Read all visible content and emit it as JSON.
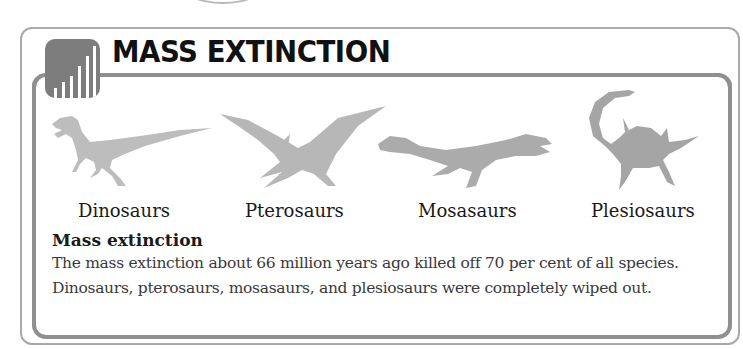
{
  "header": {
    "title": "MASS EXTINCTION",
    "icon": "bar-chart-icon"
  },
  "creatures": [
    {
      "name": "dinosaur",
      "label": "Dinosaurs",
      "icon": "dinosaur-silhouette"
    },
    {
      "name": "pterosaur",
      "label": "Pterosaurs",
      "icon": "pterosaur-silhouette"
    },
    {
      "name": "mosasaur",
      "label": "Mosasaurs",
      "icon": "mosasaur-silhouette"
    },
    {
      "name": "plesiosaur",
      "label": "Plesiosaurs",
      "icon": "plesiosaur-silhouette"
    }
  ],
  "section": {
    "heading": "Mass extinction",
    "lines": [
      "The mass extinction about 66 million years ago killed off 70 per cent of all species.",
      "Dinosaurs, pterosaurs, mosasaurs, and plesiosaurs were completely wiped out."
    ]
  },
  "colors": {
    "frame": "#8f8f8f",
    "silhouette_light": "#bdbdbd",
    "silhouette_dark": "#9a9a9a",
    "icon": "#7d7d7d"
  }
}
